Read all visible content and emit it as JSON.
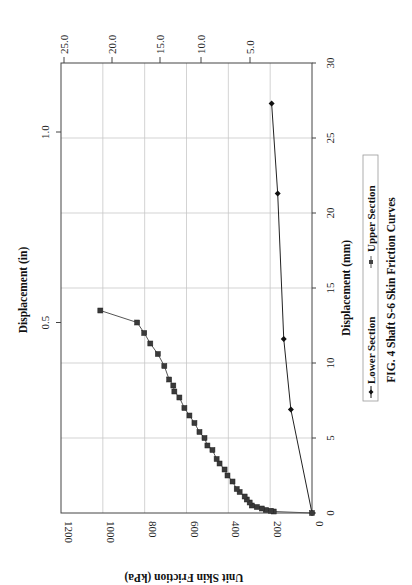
{
  "chart_data": {
    "type": "line",
    "title": "FIG. 4 Shaft S-6 Skin Friction Curves",
    "orientation": "rotated 90deg clockwise on page",
    "xlabel": "Displacement (mm)",
    "ylabel": "Unit Skin Friction (kPa)",
    "secondary_xlabel": "Displacement (in)",
    "secondary_ylabel": "",
    "xlim": [
      0,
      30
    ],
    "ylim": [
      0,
      1200
    ],
    "x_ticks": [
      "0",
      "5",
      "10",
      "15",
      "20",
      "25",
      "30"
    ],
    "y_ticks": [
      "0",
      "200",
      "400",
      "600",
      "800",
      "1000",
      "1200"
    ],
    "secondary_x_ticks": [
      "0.5",
      "1.0"
    ],
    "secondary_y_ticks": [
      "5.0",
      "10.0",
      "15.0",
      "20.0",
      "25.0"
    ],
    "grid": true,
    "legend_position": "bottom (below x-axis title)",
    "series": [
      {
        "name": "Lower Section",
        "marker": "diamond",
        "x": [
          0,
          6.9,
          11.6,
          21.3,
          27.3
        ],
        "y": [
          0,
          101,
          135,
          164,
          193
        ]
      },
      {
        "name": "Upper Section",
        "marker": "square",
        "x": [
          0,
          0.1,
          0.15,
          0.2,
          0.3,
          0.4,
          0.5,
          0.7,
          0.9,
          1.1,
          1.4,
          1.6,
          2.1,
          2.5,
          2.9,
          3.3,
          3.6,
          4.2,
          4.5,
          5.0,
          5.4,
          6.0,
          6.5,
          7.0,
          7.7,
          8.1,
          8.5,
          8.9,
          9.8,
          10.6,
          11.3,
          12.0,
          12.7,
          13.5
        ],
        "y": [
          0,
          183,
          197,
          221,
          240,
          264,
          288,
          298,
          312,
          322,
          346,
          360,
          380,
          404,
          418,
          442,
          456,
          476,
          500,
          514,
          538,
          562,
          586,
          610,
          634,
          658,
          663,
          683,
          706,
          737,
          773,
          802,
          836,
          1012
        ]
      }
    ]
  },
  "chart": {
    "xlabel": "Displacement (mm)",
    "ylabel": "Unit Skin Friction (kPa)",
    "top_label": "Displacement (in)",
    "legend": {
      "lower": "Lower Section",
      "upper": "Upper Section"
    },
    "caption": "FIG. 4 Shaft S-6 Skin Friction Curves",
    "x_ticks": [
      "0",
      "5",
      "10",
      "15",
      "20",
      "25",
      "30"
    ],
    "y_ticks": [
      "0",
      "200",
      "400",
      "600",
      "800",
      "1000",
      "1200"
    ],
    "in_ticks": [
      "0.5",
      "1.0"
    ],
    "sec_ticks": [
      "5.0",
      "10.0",
      "15.0",
      "20.0",
      "25.0"
    ]
  }
}
